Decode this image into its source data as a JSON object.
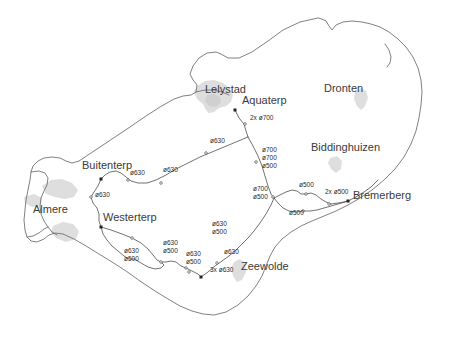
{
  "map": {
    "title": "Flevoland gas pipeline network map",
    "background_color": "#ffffff",
    "outline_color": "#6f6f6f",
    "pipe_color": "#4a4a4a",
    "urban_fill_color": "#dedede",
    "label_color": "#3a3a3a",
    "places": [
      {
        "name": "Lelystad",
        "x": 205,
        "y": 91,
        "size": "big",
        "anchor": "start"
      },
      {
        "name": "Aquaterp",
        "x": 242,
        "y": 102,
        "size": "big",
        "anchor": "start"
      },
      {
        "name": "Dronten",
        "x": 324,
        "y": 90,
        "size": "big",
        "anchor": "start"
      },
      {
        "name": "Biddinghuizen",
        "x": 311,
        "y": 149,
        "size": "big",
        "anchor": "start"
      },
      {
        "name": "Bremerberg",
        "x": 353,
        "y": 197,
        "size": "big",
        "anchor": "start"
      },
      {
        "name": "Buitenterp",
        "x": 82,
        "y": 167,
        "size": "big",
        "anchor": "start"
      },
      {
        "name": "Almere",
        "x": 33,
        "y": 211,
        "size": "big",
        "anchor": "start"
      },
      {
        "name": "Westerterp",
        "x": 103,
        "y": 219,
        "size": "big",
        "anchor": "start"
      },
      {
        "name": "Zeewolde",
        "x": 241,
        "y": 268,
        "size": "big",
        "anchor": "start"
      }
    ],
    "pipe_labels": [
      {
        "text": "2x ø700",
        "x": 250,
        "y": 119
      },
      {
        "text": "ø630",
        "x": 210,
        "y": 142
      },
      {
        "text": "ø700\nø700\nø500",
        "x": 262,
        "y": 151
      },
      {
        "text": "ø630",
        "x": 130,
        "y": 174
      },
      {
        "text": "ø630",
        "x": 163,
        "y": 171
      },
      {
        "text": "ø630",
        "x": 95,
        "y": 196
      },
      {
        "text": "ø700\nø500",
        "x": 253,
        "y": 190
      },
      {
        "text": "ø500",
        "x": 299,
        "y": 186
      },
      {
        "text": "2x ø500",
        "x": 325,
        "y": 193
      },
      {
        "text": "ø500",
        "x": 289,
        "y": 214
      },
      {
        "text": "ø630\nø500",
        "x": 212,
        "y": 225
      },
      {
        "text": "ø630\nø500",
        "x": 124,
        "y": 252
      },
      {
        "text": "ø630\nø500",
        "x": 163,
        "y": 244
      },
      {
        "text": "ø630\nø500",
        "x": 186,
        "y": 255
      },
      {
        "text": "ø630",
        "x": 224,
        "y": 253
      },
      {
        "text": "3x ø630",
        "x": 210,
        "y": 271
      }
    ],
    "nodes": [
      {
        "kind": "station",
        "x": 235,
        "y": 110
      },
      {
        "kind": "station",
        "x": 101,
        "y": 179
      },
      {
        "kind": "station",
        "x": 101,
        "y": 227
      },
      {
        "kind": "station",
        "x": 201,
        "y": 277
      },
      {
        "kind": "station",
        "x": 348,
        "y": 201
      },
      {
        "kind": "valve",
        "x": 245,
        "y": 124
      },
      {
        "kind": "valve",
        "x": 256,
        "y": 162
      },
      {
        "kind": "valve",
        "x": 206,
        "y": 153
      },
      {
        "kind": "valve",
        "x": 128,
        "y": 180
      },
      {
        "kind": "valve",
        "x": 161,
        "y": 183
      },
      {
        "kind": "valve",
        "x": 91,
        "y": 197
      },
      {
        "kind": "valve",
        "x": 273,
        "y": 197
      },
      {
        "kind": "valve",
        "x": 306,
        "y": 194
      },
      {
        "kind": "valve",
        "x": 329,
        "y": 204
      },
      {
        "kind": "valve",
        "x": 303,
        "y": 211
      },
      {
        "kind": "valve",
        "x": 132,
        "y": 238
      },
      {
        "kind": "valve",
        "x": 161,
        "y": 262
      },
      {
        "kind": "valve",
        "x": 186,
        "y": 268
      },
      {
        "kind": "valve",
        "x": 217,
        "y": 263
      },
      {
        "kind": "valve",
        "x": 189,
        "y": 272
      }
    ]
  }
}
